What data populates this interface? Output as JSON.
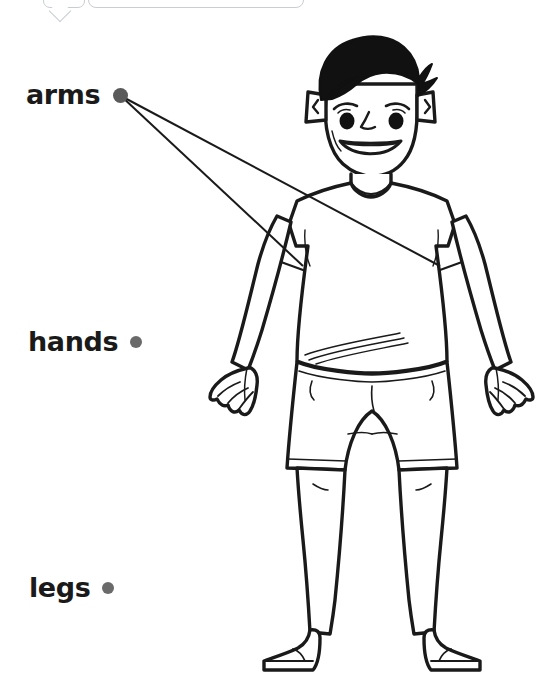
{
  "page": {
    "background_color": "#ffffff",
    "width": 538,
    "height": 685
  },
  "chrome": {
    "tooltip_name": "tooltip-callout",
    "bar_name": "toolbar-pill",
    "border_color": "#c9cdd2"
  },
  "labels": [
    {
      "id": "arms",
      "text": "arms",
      "dot_color": "#5a5a5a",
      "matched": true,
      "dot": {
        "x": 120,
        "y": 95,
        "r": 7.5
      }
    },
    {
      "id": "hands",
      "text": "hands",
      "dot_color": "#6a6a6a",
      "matched": false,
      "dot": {
        "x": 136,
        "y": 342,
        "r": 6
      }
    },
    {
      "id": "legs",
      "text": "legs",
      "dot_color": "#6a6a6a",
      "matched": false,
      "dot": {
        "x": 108,
        "y": 588,
        "r": 6
      }
    }
  ],
  "connectors": [
    {
      "name": "connector-arms-to-left-arm",
      "from_label": "arms",
      "x1": 121,
      "y1": 96,
      "x2": 303,
      "y2": 266,
      "color": "#1a1a1a",
      "width": 2
    },
    {
      "name": "connector-arms-to-right-arm",
      "from_label": "arms",
      "x1": 121,
      "y1": 96,
      "x2": 440,
      "y2": 266,
      "color": "#1a1a1a",
      "width": 2
    }
  ],
  "figure": {
    "name": "cartoon-boy-illustration",
    "stroke_color": "#1a1a1a",
    "hair_color": "#111111",
    "fill_color": "#ffffff",
    "parts": [
      "hair",
      "ears",
      "face",
      "eyebrows",
      "eyes",
      "nose",
      "mouth",
      "neck",
      "t-shirt",
      "left-arm",
      "right-arm",
      "left-hand",
      "right-hand",
      "shorts",
      "left-leg",
      "right-leg",
      "left-foot",
      "right-foot"
    ]
  }
}
